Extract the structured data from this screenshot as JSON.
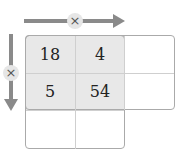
{
  "diagram": {
    "type": "multiplication-table",
    "horizontal_operator": "×",
    "vertical_operator": "×",
    "colors": {
      "arrow": "#8a8a8a",
      "shade": "#e8e8e8",
      "border": "#aaaaaa",
      "operator_bg": "#e6e6e6"
    },
    "cells": [
      [
        "18",
        "4",
        ""
      ],
      [
        "5",
        "54",
        ""
      ],
      [
        "",
        "",
        null
      ]
    ],
    "cell_r0c0": "18",
    "cell_r0c1": "4",
    "cell_r1c0": "5",
    "cell_r1c1": "54"
  }
}
